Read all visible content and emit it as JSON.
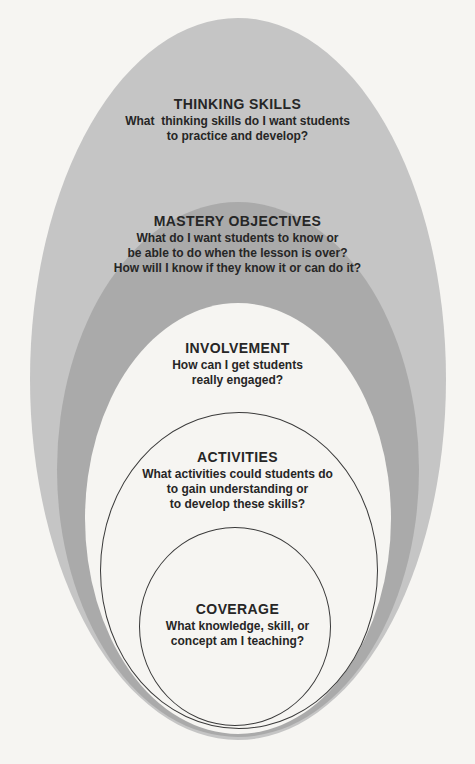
{
  "diagram": {
    "description_colors": {
      "background": "#f6f5f2",
      "outer_oval_fill": "#c5c5c5",
      "second_oval_fill": "#aaaaaa",
      "inner_oval_fill": "#f6f5f2",
      "outline": "#3a3a3a",
      "text": "#262626"
    },
    "levels": [
      {
        "id": "thinking-skills",
        "name": "THINKING SKILLS",
        "question": "What  thinking skills do I want students\nto practice and develop?"
      },
      {
        "id": "mastery-objectives",
        "name": "MASTERY OBJECTIVES",
        "question": "What do I want students to know or\nbe able to do when the lesson is over?\nHow will I know if they know it or can do it?"
      },
      {
        "id": "involvement",
        "name": "INVOLVEMENT",
        "question": "How can I get students\nreally engaged?"
      },
      {
        "id": "activities",
        "name": "ACTIVITIES",
        "question": "What activities could students do\nto gain understanding or\nto develop these skills?"
      },
      {
        "id": "coverage",
        "name": "COVERAGE",
        "question": "What knowledge, skill, or\nconcept am I teaching?"
      }
    ]
  }
}
